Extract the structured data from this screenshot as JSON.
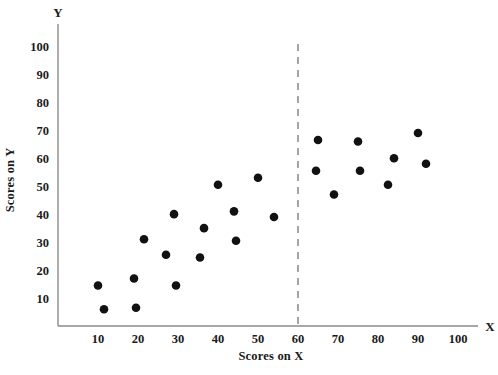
{
  "chart_data": {
    "type": "scatter",
    "title": "",
    "xlabel": "Scores on X",
    "ylabel": "Scores on Y",
    "x_axis_name": "X",
    "y_axis_name": "Y",
    "xlim": [
      0,
      105
    ],
    "ylim": [
      0,
      108
    ],
    "xticks": [
      10,
      20,
      30,
      40,
      50,
      60,
      70,
      80,
      90,
      100
    ],
    "xtick_labels": [
      "10",
      "20",
      "30",
      "40",
      "50",
      "60",
      "70",
      "80",
      "90",
      "100"
    ],
    "yticks": [
      10,
      20,
      30,
      40,
      50,
      60,
      70,
      80,
      90,
      100
    ],
    "ytick_labels": [
      "10",
      "20",
      "30",
      "40",
      "50",
      "60",
      "70",
      "80",
      "90",
      "100"
    ],
    "grid": false,
    "legend": "none",
    "marker": "filled-circle",
    "marker_color": "#111111",
    "points": [
      {
        "x": 10.0,
        "y": 14.5
      },
      {
        "x": 11.5,
        "y": 6.0
      },
      {
        "x": 19.0,
        "y": 17.0
      },
      {
        "x": 19.5,
        "y": 6.5
      },
      {
        "x": 21.5,
        "y": 31.0
      },
      {
        "x": 27.0,
        "y": 25.5
      },
      {
        "x": 29.0,
        "y": 40.0
      },
      {
        "x": 29.5,
        "y": 14.5
      },
      {
        "x": 35.5,
        "y": 24.5
      },
      {
        "x": 36.5,
        "y": 35.0
      },
      {
        "x": 40.0,
        "y": 50.5
      },
      {
        "x": 44.0,
        "y": 41.0
      },
      {
        "x": 44.5,
        "y": 30.5
      },
      {
        "x": 50.0,
        "y": 53.0
      },
      {
        "x": 54.0,
        "y": 39.0
      },
      {
        "x": 65.0,
        "y": 66.5
      },
      {
        "x": 64.5,
        "y": 55.5
      },
      {
        "x": 69.0,
        "y": 47.0
      },
      {
        "x": 75.0,
        "y": 66.0
      },
      {
        "x": 75.5,
        "y": 55.5
      },
      {
        "x": 82.5,
        "y": 50.5
      },
      {
        "x": 84.0,
        "y": 60.0
      },
      {
        "x": 90.0,
        "y": 69.0
      },
      {
        "x": 92.0,
        "y": 58.0
      }
    ],
    "annotations": [
      {
        "type": "vertical-dashed-line",
        "x": 60,
        "label": "",
        "color": "#8f8f8f"
      }
    ]
  }
}
